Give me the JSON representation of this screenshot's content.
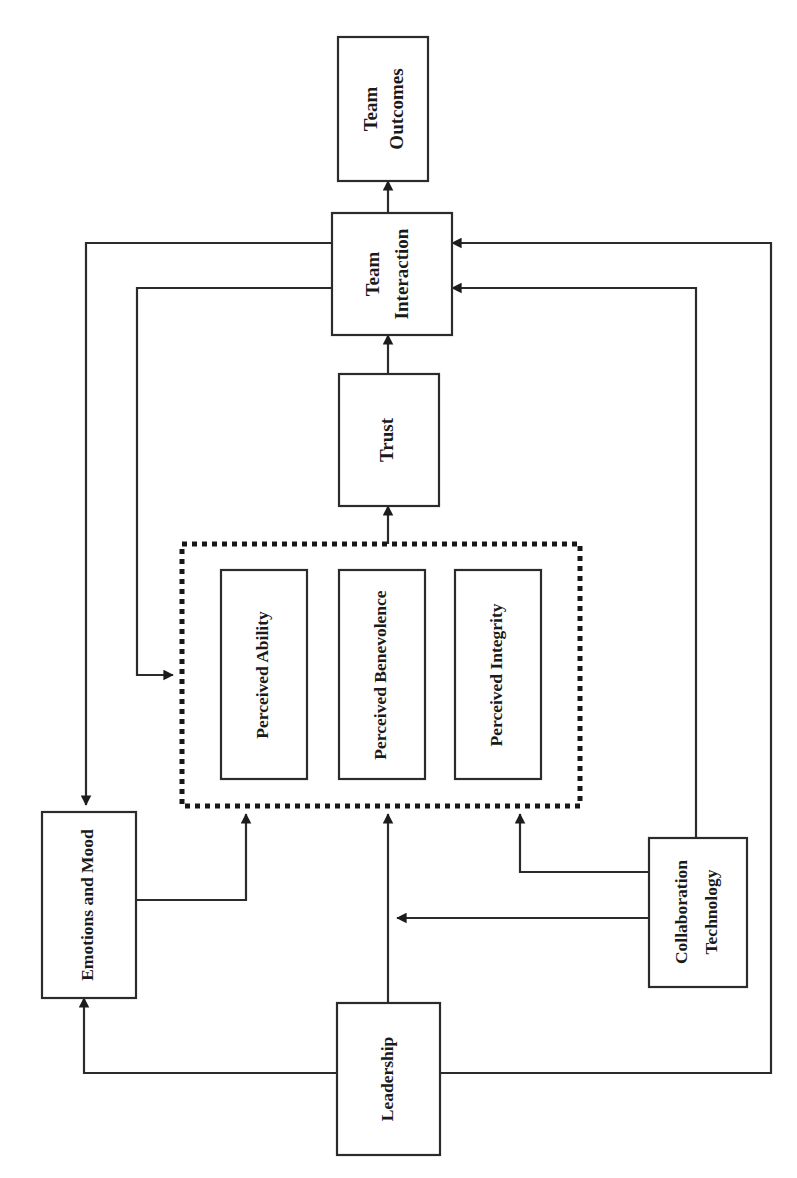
{
  "diagram": {
    "orientation": "rotated-90",
    "background_color": "#ffffff",
    "line_color": "#2b2b2b",
    "nodes": [
      {
        "id": "team_outcomes",
        "label_line1": "Team",
        "label_line2": "Outcomes"
      },
      {
        "id": "team_interaction",
        "label_line1": "Team",
        "label_line2": "Interaction"
      },
      {
        "id": "trust",
        "label_line1": "Trust",
        "label_line2": ""
      },
      {
        "id": "perceived_ability",
        "label_line1": "Perceived Ability",
        "label_line2": ""
      },
      {
        "id": "perceived_benevolence",
        "label_line1": "Perceived Benevolence",
        "label_line2": ""
      },
      {
        "id": "perceived_integrity",
        "label_line1": "Perceived Integrity",
        "label_line2": ""
      },
      {
        "id": "emotions_and_mood",
        "label_line1": "Emotions and Mood",
        "label_line2": ""
      },
      {
        "id": "collaboration_technology",
        "label_line1": "Collaboration",
        "label_line2": "Technology"
      },
      {
        "id": "leadership",
        "label_line1": "Leadership",
        "label_line2": ""
      }
    ],
    "group": {
      "id": "trustworthiness_group",
      "label": "",
      "members": [
        "perceived_ability",
        "perceived_benevolence",
        "perceived_integrity"
      ],
      "border_style": "dotted"
    },
    "edges": [
      {
        "from": "team_interaction",
        "to": "team_outcomes"
      },
      {
        "from": "trust",
        "to": "team_interaction"
      },
      {
        "from": "trustworthiness_group",
        "to": "trust"
      },
      {
        "from": "team_interaction",
        "to": "emotions_and_mood"
      },
      {
        "from": "team_interaction",
        "to": "trustworthiness_group"
      },
      {
        "from": "emotions_and_mood",
        "to": "trustworthiness_group"
      },
      {
        "from": "leadership",
        "to": "trustworthiness_group"
      },
      {
        "from": "collaboration_technology",
        "to": "trustworthiness_group"
      },
      {
        "from": "leadership",
        "to": "emotions_and_mood"
      },
      {
        "from": "leadership",
        "to": "team_interaction"
      },
      {
        "from": "collaboration_technology",
        "to": "team_interaction"
      },
      {
        "from": "collaboration_technology",
        "to": "leadership"
      }
    ]
  }
}
